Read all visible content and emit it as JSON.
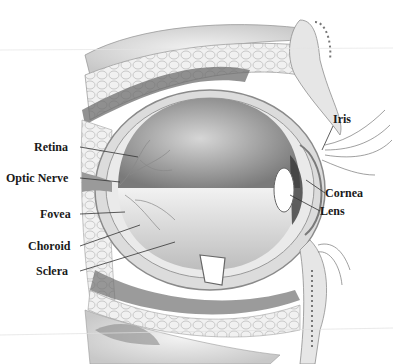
{
  "diagram": {
    "colors": {
      "background": "#ffffff",
      "ink": "#1a1a1a",
      "shade": "#8a8a8a"
    },
    "labels": {
      "retina": "Retina",
      "optic_nerve": "Optic Nerve",
      "fovea": "Fovea",
      "choroid": "Choroid",
      "sclera": "Sclera",
      "iris": "Iris",
      "cornea": "Cornea",
      "lens": "Lens"
    }
  }
}
